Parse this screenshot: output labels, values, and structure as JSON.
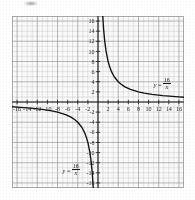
{
  "chart_data": {
    "type": "line",
    "title": "",
    "xlabel": "x",
    "ylabel": "y",
    "function": "y = 16/x",
    "equation_numerator": "16",
    "equation_denominator": "x",
    "equation_lhs": "y =",
    "xlim": [
      -17,
      17
    ],
    "ylim": [
      -17,
      17
    ],
    "grid": true,
    "minor_grid_step": 1,
    "major_grid_step": 4,
    "legend": "none",
    "annotations": [
      {
        "text": "y = 16/x",
        "branch": "upper-right",
        "x": 11,
        "y": 3.5
      },
      {
        "text": "y = 16/x",
        "branch": "lower-left",
        "x": -7,
        "y": -13.5
      }
    ],
    "x_ticks": [
      -16,
      -14,
      -12,
      -10,
      -8,
      -6,
      -4,
      -2,
      2,
      4,
      6,
      8,
      10,
      12,
      14,
      16
    ],
    "y_ticks": [
      16,
      14,
      12,
      10,
      8,
      6,
      4,
      2,
      -2,
      -4,
      -6,
      -8,
      -10,
      -12,
      -14,
      -16
    ],
    "x_tick_labels": [
      "-16",
      "-14",
      "-12",
      "-10",
      "-8",
      "-6",
      "-4",
      "-2",
      "2",
      "4",
      "6",
      "8",
      "10",
      "12",
      "14",
      "16"
    ],
    "y_tick_labels": [
      "16",
      "14",
      "12",
      "10",
      "8",
      "6",
      "4",
      "2",
      "-2",
      "-4",
      "-6",
      "-8",
      "-10",
      "-12",
      "-14",
      "-16"
    ],
    "series": [
      {
        "name": "y = 16/x (branch x > 0)",
        "points": [
          [
            0.94,
            17.0
          ],
          [
            1,
            16
          ],
          [
            1.14,
            14
          ],
          [
            1.33,
            12
          ],
          [
            1.6,
            10
          ],
          [
            2,
            8
          ],
          [
            2.29,
            7
          ],
          [
            2.67,
            6
          ],
          [
            3.2,
            5
          ],
          [
            4,
            4
          ],
          [
            4.57,
            3.5
          ],
          [
            5.33,
            3
          ],
          [
            6.4,
            2.5
          ],
          [
            8,
            2
          ],
          [
            9.14,
            1.75
          ],
          [
            10.67,
            1.5
          ],
          [
            12.8,
            1.25
          ],
          [
            16,
            1
          ],
          [
            17,
            0.94
          ]
        ]
      },
      {
        "name": "y = 16/x (branch x < 0)",
        "points": [
          [
            -17,
            -0.94
          ],
          [
            -16,
            -1
          ],
          [
            -12.8,
            -1.25
          ],
          [
            -10.67,
            -1.5
          ],
          [
            -9.14,
            -1.75
          ],
          [
            -8,
            -2
          ],
          [
            -6.4,
            -2.5
          ],
          [
            -5.33,
            -3
          ],
          [
            -4.57,
            -3.5
          ],
          [
            -4,
            -4
          ],
          [
            -3.2,
            -5
          ],
          [
            -2.67,
            -6
          ],
          [
            -2.29,
            -7
          ],
          [
            -2,
            -8
          ],
          [
            -1.6,
            -10
          ],
          [
            -1.33,
            -12
          ],
          [
            -1.14,
            -14
          ],
          [
            -1,
            -16
          ],
          [
            -0.94,
            -17
          ]
        ]
      }
    ],
    "colors": {
      "curve": "#111111",
      "axis": "#1a1a1a",
      "minor_grid": "#c9c9c9",
      "major_grid": "#9a9a9a",
      "background": "#ffffff",
      "plot_background": "#fbfbfb"
    }
  }
}
